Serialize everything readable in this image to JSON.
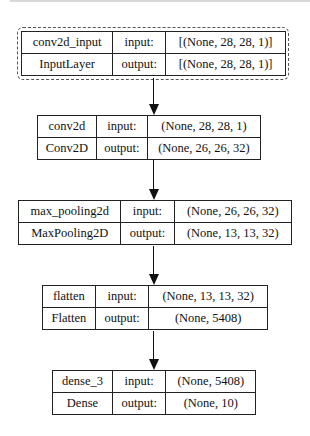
{
  "diagram": {
    "type": "keras-model-plot",
    "labels": {
      "input": "input:",
      "output": "output:"
    },
    "layers": [
      {
        "name": "conv2d_input",
        "class": "InputLayer",
        "input_shape": "[(None, 28, 28, 1)]",
        "output_shape": "[(None, 28, 28, 1)]"
      },
      {
        "name": "conv2d",
        "class": "Conv2D",
        "input_shape": "(None, 28, 28, 1)",
        "output_shape": "(None, 26, 26, 32)"
      },
      {
        "name": "max_pooling2d",
        "class": "MaxPooling2D",
        "input_shape": "(None, 26, 26, 32)",
        "output_shape": "(None, 13, 13, 32)"
      },
      {
        "name": "flatten",
        "class": "Flatten",
        "input_shape": "(None, 13, 13, 32)",
        "output_shape": "(None, 5408)"
      },
      {
        "name": "dense_3",
        "class": "Dense",
        "input_shape": "(None, 5408)",
        "output_shape": "(None, 10)"
      }
    ],
    "edges": [
      {
        "from": "conv2d_input",
        "to": "conv2d"
      },
      {
        "from": "conv2d",
        "to": "max_pooling2d"
      },
      {
        "from": "max_pooling2d",
        "to": "flatten"
      },
      {
        "from": "flatten",
        "to": "dense_3"
      }
    ]
  }
}
